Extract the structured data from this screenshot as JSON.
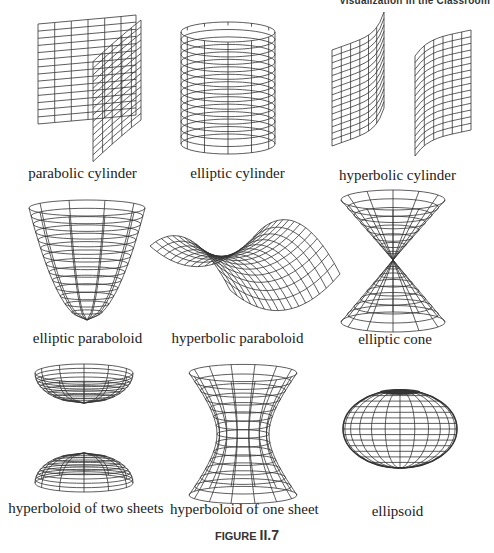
{
  "running_head": "Visualization in the Classroom",
  "surfaces": [
    {
      "id": "parabolic-cylinder",
      "label": "parabolic cylinder"
    },
    {
      "id": "elliptic-cylinder",
      "label": "elliptic cylinder"
    },
    {
      "id": "hyperbolic-cylinder",
      "label": "hyperbolic cylinder"
    },
    {
      "id": "elliptic-paraboloid",
      "label": "elliptic paraboloid"
    },
    {
      "id": "hyperbolic-paraboloid",
      "label": "hyperbolic paraboloid"
    },
    {
      "id": "elliptic-cone",
      "label": "elliptic cone"
    },
    {
      "id": "hyperboloid-two-sheets",
      "label": "hyperboloid of two sheets"
    },
    {
      "id": "hyperboloid-one-sheet",
      "label": "hyperboloid of one sheet"
    },
    {
      "id": "ellipsoid",
      "label": "ellipsoid"
    }
  ],
  "caption": {
    "prefix": "FIGURE",
    "number": "II.7"
  }
}
